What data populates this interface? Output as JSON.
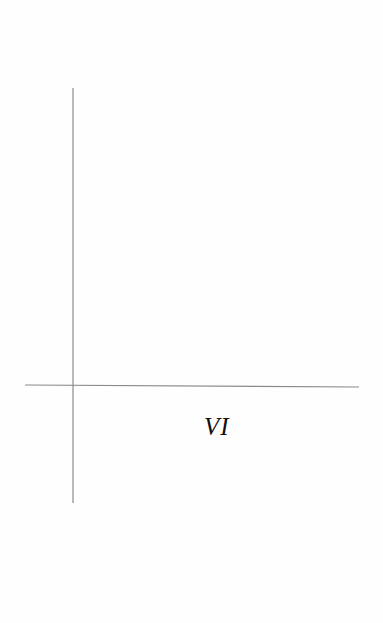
{
  "diagram": {
    "type": "coordinate-axes",
    "colors": {
      "background": "#fefefe",
      "axis_line": "#8a8a8a",
      "label": "#111111"
    },
    "vertical_axis": {
      "x": 73,
      "y_start": 88,
      "y_end": 503
    },
    "horizontal_axis": {
      "y_left": 385,
      "y_right": 387,
      "x_start": 25,
      "x_end": 359
    },
    "labels": [
      {
        "id": "quadrant-label",
        "text": "VI"
      }
    ]
  }
}
